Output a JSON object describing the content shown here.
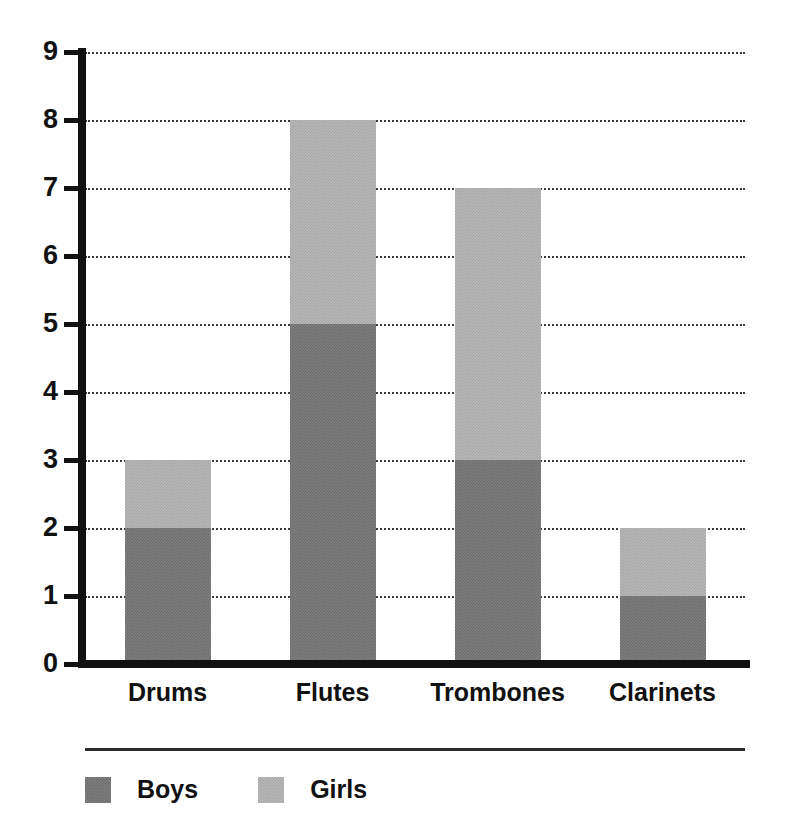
{
  "chart_data": {
    "type": "bar",
    "subtype": "stacked-bar",
    "title": "",
    "xlabel": "",
    "ylabel": "",
    "ylim": [
      0,
      9
    ],
    "ytick_step": 1,
    "yticks": [
      9,
      8,
      7,
      6,
      5,
      4,
      3,
      2,
      1,
      0
    ],
    "grid": true,
    "grid_style": "dotted",
    "legend_position": "bottom-left",
    "categories": [
      "Drums",
      "Flutes",
      "Trombones",
      "Clarinets"
    ],
    "series": [
      {
        "name": "Boys",
        "color": "#808080",
        "values": [
          2,
          5,
          3,
          1
        ]
      },
      {
        "name": "Girls",
        "color": "#b9b9b9",
        "values": [
          1,
          3,
          4,
          1
        ]
      }
    ],
    "totals": [
      3,
      8,
      7,
      2
    ]
  },
  "axis": {
    "y_tick_labels": [
      "9",
      "8",
      "7",
      "6",
      "5",
      "4",
      "3",
      "2",
      "1",
      "0"
    ],
    "x_tick_labels": [
      "Drums",
      "Flutes",
      "Trombones",
      "Clarinets"
    ]
  },
  "legend": {
    "items": [
      {
        "label": "Boys",
        "color": "#808080"
      },
      {
        "label": "Girls",
        "color": "#b9b9b9"
      }
    ]
  },
  "colors": {
    "boys": "#808080",
    "girls": "#b9b9b9",
    "axis": "#111111",
    "grid": "#1a1a1a",
    "background": "#ffffff"
  }
}
